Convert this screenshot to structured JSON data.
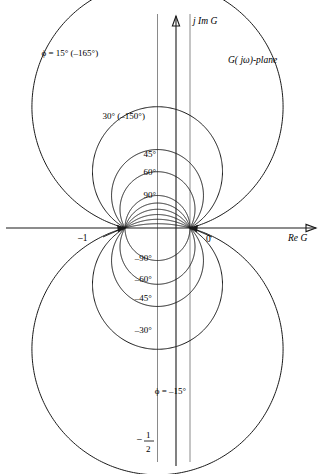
{
  "figure": {
    "plane_label": "G( jω)-plane",
    "axes": {
      "real_label": "Re G",
      "imag_label": "j Im G",
      "real_axis_y_value": 0,
      "imag_axis_x_value": 0
    },
    "tick_labels": {
      "minus_one": "–1",
      "zero": "0",
      "minus_half": {
        "sign": "–",
        "numerator": "1",
        "denominator": "2"
      }
    },
    "guides": [
      {
        "name": "vertical-line-minus-half",
        "x_value": -0.5,
        "color": "#8a8a8a"
      },
      {
        "name": "imaginary-axis",
        "x_value": 0,
        "color": "#8a8a8a"
      }
    ],
    "singular_points": [
      {
        "name": "point-minus-one",
        "x": -1,
        "y": 0,
        "label": "–1"
      },
      {
        "name": "point-zero",
        "x": 0,
        "y": 0,
        "label": "0"
      }
    ],
    "colors": {
      "locus": "#1a1a1a",
      "axis": "#1a1a1a",
      "guide": "#8a8a8a",
      "background": "#ffffff"
    }
  },
  "chart_data": {
    "type": "line",
    "xlabel": "Re G",
    "ylabel": "j Im G",
    "xlim": [
      -2.25,
      2.25
    ],
    "ylim": [
      -2.9,
      2.9
    ],
    "grid": false,
    "legend": "inline-annotations",
    "series": [
      {
        "name": "φ = 15° (–165°)",
        "phi_deg": 15,
        "half": "upper",
        "center": [
          -0.5,
          1.866
        ],
        "radius": 1.932,
        "label": "ϕ = 15° (–165°)",
        "label_pos": [
          -1.85,
          2.65
        ]
      },
      {
        "name": "30° (–150°)",
        "phi_deg": 30,
        "half": "upper",
        "center": [
          -0.5,
          0.866
        ],
        "radius": 1.0,
        "label": "30° (–150°)",
        "label_pos": [
          -1.02,
          1.68
        ]
      },
      {
        "name": "45°",
        "phi_deg": 45,
        "half": "upper",
        "center": [
          -0.5,
          0.5
        ],
        "radius": 0.707,
        "label": "45°",
        "label_pos": [
          -0.62,
          1.1
        ]
      },
      {
        "name": "60°",
        "phi_deg": 60,
        "half": "upper",
        "center": [
          -0.5,
          0.289
        ],
        "radius": 0.577,
        "label": "60°",
        "label_pos": [
          -0.62,
          0.82
        ]
      },
      {
        "name": "90°",
        "phi_deg": 90,
        "half": "upper",
        "center": [
          -0.5,
          0.0
        ],
        "radius": 0.5,
        "label": "90°",
        "label_pos": [
          -0.62,
          0.46
        ]
      },
      {
        "name": "105°",
        "phi_deg": 105,
        "half": "upper",
        "center": [
          -0.5,
          -0.134
        ],
        "radius": 0.518,
        "label": "",
        "label_pos": null
      },
      {
        "name": "120°",
        "phi_deg": 120,
        "half": "upper",
        "center": [
          -0.5,
          -0.289
        ],
        "radius": 0.577,
        "label": "",
        "label_pos": null
      },
      {
        "name": "135°",
        "phi_deg": 135,
        "half": "upper",
        "center": [
          -0.5,
          -0.5
        ],
        "radius": 0.707,
        "label": "",
        "label_pos": null
      },
      {
        "name": "150°",
        "phi_deg": 150,
        "half": "upper",
        "center": [
          -0.5,
          -0.866
        ],
        "radius": 1.0,
        "label": "",
        "label_pos": null
      },
      {
        "name": "165°",
        "phi_deg": 165,
        "half": "upper",
        "center": [
          -0.5,
          -1.866
        ],
        "radius": 1.932,
        "label": "",
        "label_pos": null
      },
      {
        "name": "–15°",
        "phi_deg": -15,
        "half": "lower",
        "center": [
          -0.5,
          -1.866
        ],
        "radius": 1.932,
        "label": "ϕ = –15°",
        "label_pos": [
          -0.3,
          -2.55
        ]
      },
      {
        "name": "–30°",
        "phi_deg": -30,
        "half": "lower",
        "center": [
          -0.5,
          -0.866
        ],
        "radius": 1.0,
        "label": "–30°",
        "label_pos": [
          -0.72,
          -1.62
        ]
      },
      {
        "name": "–45°",
        "phi_deg": -45,
        "half": "lower",
        "center": [
          -0.5,
          -0.5
        ],
        "radius": 0.707,
        "label": "–45°",
        "label_pos": [
          -0.72,
          -1.12
        ]
      },
      {
        "name": "–60°",
        "phi_deg": -60,
        "half": "lower",
        "center": [
          -0.5,
          -0.289
        ],
        "radius": 0.577,
        "label": "–60°",
        "label_pos": [
          -0.72,
          -0.83
        ]
      },
      {
        "name": "–90°",
        "phi_deg": -90,
        "half": "lower",
        "center": [
          -0.5,
          0.0
        ],
        "radius": 0.5,
        "label": "–90°",
        "label_pos": [
          -0.72,
          -0.5
        ]
      }
    ],
    "arrow_markers": [
      {
        "name": "arrow-into-minus-one",
        "at": [
          -1,
          0
        ],
        "direction": "right"
      },
      {
        "name": "arrow-into-zero",
        "at": [
          0,
          0
        ],
        "direction": "left"
      }
    ]
  }
}
